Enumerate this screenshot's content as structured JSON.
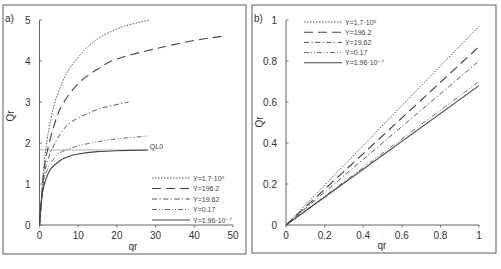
{
  "chart_data": [
    {
      "panel": "a)",
      "type": "line",
      "xlabel": "qr",
      "ylabel": "Qr",
      "xlim": [
        0,
        50
      ],
      "ylim": [
        0,
        5
      ],
      "xticks": [
        0,
        10,
        20,
        30,
        40,
        50
      ],
      "yticks": [
        0,
        1,
        2,
        3,
        4,
        5
      ],
      "grid": false,
      "legend_position": "lower right",
      "annotations": [
        {
          "text": "QL0",
          "type": "hline",
          "y": 1.83,
          "x_end": 28
        }
      ],
      "series": [
        {
          "name": "Y=1.7·10⁸",
          "style": "dotted",
          "x": [
            0,
            1,
            2,
            3,
            4,
            6,
            8,
            12,
            16,
            22,
            28.5
          ],
          "y": [
            0,
            1.3,
            2.1,
            2.6,
            3.0,
            3.5,
            3.85,
            4.3,
            4.6,
            4.85,
            5.0
          ]
        },
        {
          "name": "Y=196.2",
          "style": "long-dash",
          "x": [
            0,
            1,
            2,
            4,
            6,
            10,
            15,
            20,
            30,
            40,
            47
          ],
          "y": [
            0,
            1.2,
            1.8,
            2.5,
            2.95,
            3.45,
            3.8,
            4.05,
            4.3,
            4.5,
            4.6
          ]
        },
        {
          "name": "Y=19.62",
          "style": "dash-dot",
          "x": [
            0,
            1,
            2,
            4,
            6,
            8,
            12,
            16,
            23
          ],
          "y": [
            0,
            1.05,
            1.55,
            2.0,
            2.3,
            2.5,
            2.7,
            2.85,
            3.0
          ]
        },
        {
          "name": "Y=0.17",
          "style": "dash-dot-dot",
          "x": [
            0,
            1,
            2,
            4,
            6,
            10,
            15,
            20,
            28
          ],
          "y": [
            0,
            1.0,
            1.35,
            1.65,
            1.8,
            1.93,
            2.03,
            2.1,
            2.17
          ]
        },
        {
          "name": "Y=1.96·10⁻⁷",
          "style": "solid",
          "x": [
            0,
            0.5,
            1,
            2,
            3,
            5,
            7,
            10,
            15,
            20,
            28
          ],
          "y": [
            0,
            0.6,
            0.9,
            1.2,
            1.38,
            1.55,
            1.65,
            1.73,
            1.79,
            1.81,
            1.83
          ]
        }
      ]
    },
    {
      "panel": "b)",
      "type": "line",
      "xlabel": "qr",
      "ylabel": "Qr",
      "xlim": [
        0,
        1
      ],
      "ylim": [
        0,
        1
      ],
      "xticks": [
        0,
        0.2,
        0.4,
        0.6,
        0.8,
        1
      ],
      "yticks": [
        0,
        0.2,
        0.4,
        0.6,
        0.8,
        1
      ],
      "grid": false,
      "legend_position": "upper left",
      "series": [
        {
          "name": "Y=1.7·10⁸",
          "style": "dotted",
          "x": [
            0,
            1
          ],
          "y": [
            0,
            0.97
          ]
        },
        {
          "name": "Y=196.2",
          "style": "long-dash",
          "x": [
            0,
            1
          ],
          "y": [
            0,
            0.87
          ]
        },
        {
          "name": "Y=19.62",
          "style": "dash-dot",
          "x": [
            0,
            1
          ],
          "y": [
            0,
            0.8
          ]
        },
        {
          "name": "Y=0.17",
          "style": "dash-dot-dot",
          "x": [
            0,
            1
          ],
          "y": [
            0,
            0.7
          ]
        },
        {
          "name": "Y=1.96·10⁻⁷",
          "style": "solid",
          "x": [
            0,
            1
          ],
          "y": [
            0,
            0.68
          ]
        }
      ]
    }
  ],
  "layout": {
    "panels": [
      {
        "frame": [
          3,
          5,
          246,
          254
        ],
        "plot": {
          "x0": 39.5,
          "x1": 233,
          "y0": 225,
          "y1": 20
        },
        "legend": {
          "x": 152,
          "y": 178,
          "row_h": 10.5,
          "line_w": 38
        },
        "ylabel_pos": [
          14,
          116
        ],
        "xlabel_pos": [
          133,
          250
        ],
        "tag_pos": [
          5,
          22
        ]
      },
      {
        "frame": [
          252,
          5,
          496,
          253
        ],
        "plot": {
          "x0": 286,
          "x1": 479,
          "y0": 225,
          "y1": 20
        },
        "legend": {
          "x": 304,
          "y": 22,
          "row_h": 10.2,
          "line_w": 38
        },
        "ylabel_pos": [
          263,
          122
        ],
        "xlabel_pos": [
          382,
          249
        ],
        "tag_pos": [
          254,
          22
        ]
      }
    ],
    "colors": {
      "frame": "#777777",
      "axis": "#555555",
      "series": "#444444",
      "hline": "#999999"
    }
  }
}
